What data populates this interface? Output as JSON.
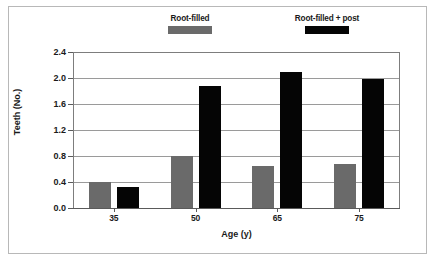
{
  "chart_data": {
    "type": "bar",
    "title": "",
    "xlabel": "Age (y)",
    "ylabel": "Teeth (No.)",
    "categories": [
      "35",
      "50",
      "65",
      "75"
    ],
    "series": [
      {
        "name": "Root-filled",
        "color": "#6a6a6a",
        "values": [
          0.4,
          0.8,
          0.65,
          0.68
        ]
      },
      {
        "name": "Root-filled + post",
        "color": "#050505",
        "values": [
          0.32,
          1.87,
          2.1,
          1.98
        ]
      }
    ],
    "ylim": [
      0.0,
      2.4
    ],
    "ytick_labels": [
      "0.0",
      "0.4",
      "0.8",
      "1.2",
      "1.6",
      "2.0",
      "2.4"
    ],
    "ytick_values": [
      0.0,
      0.4,
      0.8,
      1.2,
      1.6,
      2.0,
      2.4
    ],
    "grid": true,
    "legend_position": "top"
  },
  "legend": {
    "entries": [
      {
        "label": "Root-filled",
        "color": "#6a6a6a"
      },
      {
        "label": "Root-filled + post",
        "color": "#050505"
      }
    ]
  },
  "axes": {
    "y_title": "Teeth (No.)",
    "x_title": "Age (y)"
  }
}
